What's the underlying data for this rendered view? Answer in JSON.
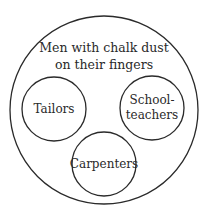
{
  "diagram": {
    "type": "nested-circles",
    "outer": {
      "label_line1": "Men with chalk dust",
      "label_line2": "on their fingers"
    },
    "inner": [
      {
        "label_line1": "Tailors"
      },
      {
        "label_line1": "School-",
        "label_line2": "teachers"
      },
      {
        "label_line1": "Carpenters"
      }
    ],
    "stroke_color": "#2a2a2a",
    "background": "#ffffff"
  }
}
